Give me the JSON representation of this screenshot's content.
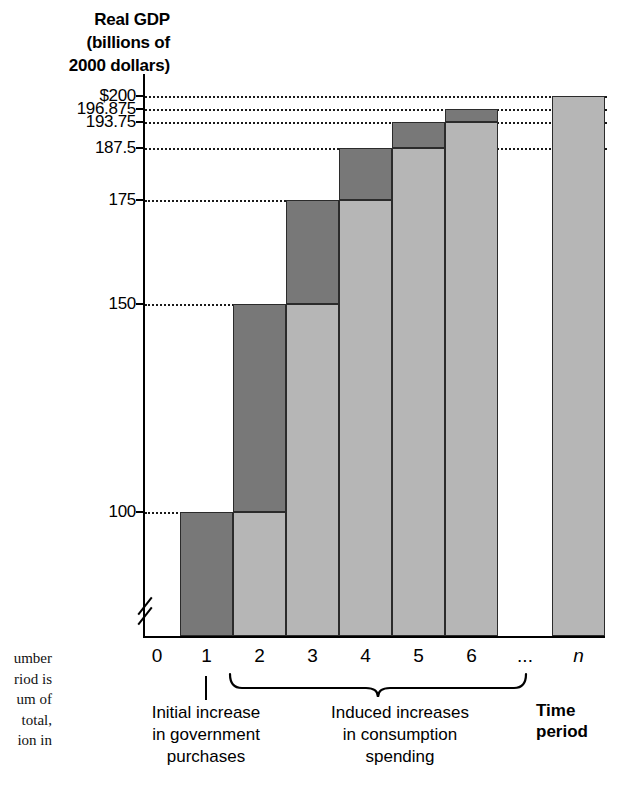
{
  "chart_data": {
    "type": "bar",
    "title": "Real GDP (billions of 2000 dollars)",
    "xlabel": "Time period",
    "ylabel": "Real GDP (billions of 2000 dollars)",
    "ylim": [
      75,
      205
    ],
    "grid": true,
    "legend": "none",
    "categories": [
      "1",
      "2",
      "3",
      "4",
      "5",
      "6",
      "...",
      "n"
    ],
    "values": [
      100,
      150,
      175,
      187.5,
      193.75,
      196.875,
      null,
      200
    ],
    "series": [
      {
        "name": "Previous level (light gray base)",
        "values": [
          0,
          100,
          150,
          175,
          187.5,
          193.75,
          null,
          200
        ]
      },
      {
        "name": "Increment this period (dark gray cap)",
        "values": [
          100,
          50,
          25,
          12.5,
          6.25,
          3.125,
          null,
          0
        ]
      }
    ],
    "ytick_labels": [
      "$200",
      "196.875",
      "193.75",
      "187.5",
      "175",
      "150",
      "100"
    ],
    "ytick_values": [
      200,
      196.875,
      193.75,
      187.5,
      175,
      150,
      100
    ],
    "xtick_labels": [
      "0",
      "1",
      "2",
      "3",
      "4",
      "5",
      "6",
      "...",
      "n"
    ],
    "axis_break": true,
    "annotations": [
      "Initial increase in government purchases",
      "Induced increases in consumption spending"
    ]
  },
  "axis": {
    "y_title_lines": [
      "Real GDP",
      "(billions of",
      "2000 dollars)"
    ],
    "y_ticks": [
      {
        "label": "$200",
        "value": 200
      },
      {
        "label": "196.875",
        "value": 196.875
      },
      {
        "label": "193.75",
        "value": 193.75
      },
      {
        "label": "187.5",
        "value": 187.5
      },
      {
        "label": "175",
        "value": 175
      },
      {
        "label": "150",
        "value": 150
      },
      {
        "label": "100",
        "value": 100
      }
    ],
    "x_ticks": [
      {
        "label": "0",
        "italic": false
      },
      {
        "label": "1",
        "italic": false
      },
      {
        "label": "2",
        "italic": false
      },
      {
        "label": "3",
        "italic": false
      },
      {
        "label": "4",
        "italic": false
      },
      {
        "label": "5",
        "italic": false
      },
      {
        "label": "6",
        "italic": false
      },
      {
        "label": "...",
        "italic": false
      },
      {
        "label": "n",
        "italic": true
      }
    ],
    "x_axis_title_lines": [
      "Time",
      "period"
    ]
  },
  "annotations": {
    "initial": {
      "lines": [
        "Initial increase",
        "in government",
        "purchases"
      ]
    },
    "induced": {
      "lines": [
        "Induced increases",
        "in consumption",
        "spending"
      ]
    }
  },
  "margin_caption": {
    "lines": [
      "umber",
      "riod is",
      "um of",
      "total,",
      "ion in"
    ]
  },
  "colors": {
    "increment": "#787878",
    "base": "#b6b6b6",
    "outline": "#2b2b2b",
    "axis": "#000000"
  }
}
